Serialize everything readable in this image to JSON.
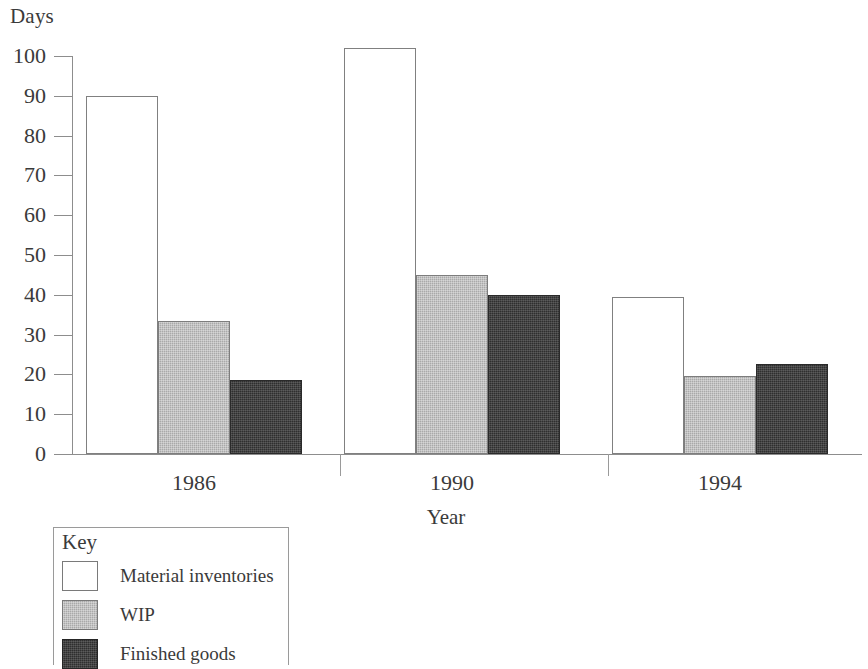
{
  "chart_data": {
    "type": "bar",
    "title": "",
    "xlabel": "Year",
    "ylabel": "Days",
    "categories": [
      "1986",
      "1990",
      "1994"
    ],
    "series": [
      {
        "name": "Material inventories",
        "values": [
          90,
          102,
          39.5
        ],
        "color": "#ffffff"
      },
      {
        "name": "WIP",
        "values": [
          33.5,
          45,
          19.5
        ],
        "color": "#a9a9a9"
      },
      {
        "name": "Finished goods",
        "values": [
          18.5,
          40,
          22.5
        ],
        "color": "#2f2f2f"
      }
    ],
    "ylim": [
      0,
      100
    ],
    "ytick_labels": [
      "0",
      "10",
      "20",
      "30",
      "40",
      "50",
      "60",
      "70",
      "80",
      "90",
      "100"
    ],
    "ytick_values": [
      0,
      10,
      20,
      30,
      40,
      50,
      60,
      70,
      80,
      90,
      100
    ],
    "grid": false,
    "legend_position": "below-left"
  },
  "legend": {
    "title": "Key",
    "entries": [
      {
        "label": "Material inventories",
        "swatch": "material"
      },
      {
        "label": "WIP",
        "swatch": "wip"
      },
      {
        "label": "Finished goods",
        "swatch": "finished"
      }
    ]
  },
  "colors": {
    "material": "#ffffff",
    "wip": "#a9a9a9",
    "finished": "#2f2f2f",
    "axis": "#8d8d8d",
    "text": "#3a3a3a",
    "background": "#ffffff"
  }
}
